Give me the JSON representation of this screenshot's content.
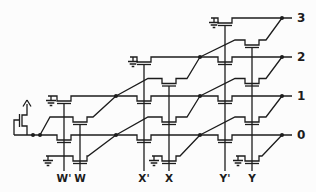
{
  "figure": {
    "kind": "transistor-array-schematic",
    "colors": {
      "stroke": "#1c1c1c",
      "background": "#fcfcfc"
    },
    "outputs": [
      {
        "label": "3"
      },
      {
        "label": "2"
      },
      {
        "label": "1"
      },
      {
        "label": "0"
      }
    ],
    "inputs": [
      {
        "label": "W'"
      },
      {
        "label": "W"
      },
      {
        "label": "X'"
      },
      {
        "label": "X"
      },
      {
        "label": "Y'"
      },
      {
        "label": "Y"
      }
    ],
    "symbols": {
      "ground_count": 6,
      "junction_dot_count": 11,
      "pass_transistor_count": 18,
      "pullup": "depletion-load-with-vdd-arrow"
    }
  }
}
